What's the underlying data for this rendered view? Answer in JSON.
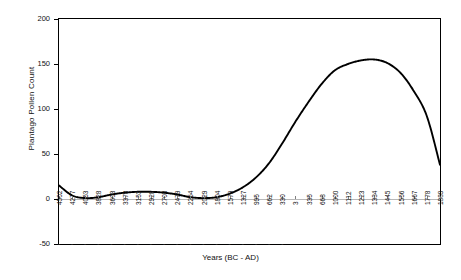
{
  "chart_data": {
    "type": "line",
    "title": "",
    "xlabel": "Years (BC - AD)",
    "ylabel": "Plantago Pollen Count",
    "ylim": [
      -50,
      200
    ],
    "yticks": [
      200,
      150,
      100,
      50,
      0,
      -50
    ],
    "ytick_labels": [
      "200",
      "150",
      "100",
      "50",
      "0",
      "-50"
    ],
    "grid": false,
    "legend": "none",
    "era_note": "labels left of 3 are BC (shown with leading dash), labels from 3 rightward are AD",
    "categories": [
      "4502",
      "4277",
      "4053",
      "3828",
      "3603",
      "3378",
      "3153",
      "2928",
      "2703",
      "2479",
      "2254",
      "2029",
      "1804",
      "1579",
      "1327",
      "995",
      "662",
      "330",
      "3",
      "335",
      "668",
      "1000",
      "1112",
      "1223",
      "1334",
      "1445",
      "1556",
      "1667",
      "1778",
      "1889"
    ],
    "era": [
      "BC",
      "BC",
      "BC",
      "BC",
      "BC",
      "BC",
      "BC",
      "BC",
      "BC",
      "BC",
      "BC",
      "BC",
      "BC",
      "BC",
      "BC",
      "BC",
      "BC",
      "BC",
      "AD",
      "AD",
      "AD",
      "AD",
      "AD",
      "AD",
      "AD",
      "AD",
      "AD",
      "AD",
      "AD",
      "AD"
    ],
    "values": [
      15,
      4,
      1,
      2,
      5,
      7,
      8,
      8,
      7,
      5,
      2,
      1,
      2,
      6,
      13,
      24,
      40,
      62,
      86,
      108,
      128,
      143,
      150,
      154,
      155,
      151,
      140,
      120,
      92,
      38
    ]
  },
  "axis": {
    "x_title": "Years (BC - AD)",
    "y_title": "Plantago Pollen Count"
  },
  "series": {
    "name": "Plantago pollen count curve",
    "color": "#000000"
  }
}
